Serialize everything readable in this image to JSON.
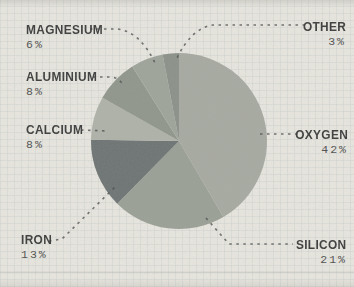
{
  "chart_data": {
    "type": "pie",
    "direction": "clockwise",
    "start_angle_deg": 0,
    "slices": [
      {
        "label": "OXYGEN",
        "pct_label": "42%",
        "value": 42,
        "color": "#a7aaa1"
      },
      {
        "label": "SILICON",
        "pct_label": "21%",
        "value": 21,
        "color": "#9aa096"
      },
      {
        "label": "IRON",
        "pct_label": "13%",
        "value": 13,
        "color": "#6c7372"
      },
      {
        "label": "CALCIUM",
        "pct_label": "8%",
        "value": 8,
        "color": "#afb2a8"
      },
      {
        "label": "ALUMINIUM",
        "pct_label": "8%",
        "value": 8,
        "color": "#90968b"
      },
      {
        "label": "MAGNESIUM",
        "pct_label": "6%",
        "value": 6,
        "color": "#9ea49a"
      },
      {
        "label": "OTHER",
        "pct_label": "3%",
        "value": 3,
        "color": "#8b9189"
      }
    ]
  },
  "colors": {
    "background": "#e9e7e0",
    "label_text": "#3a3a3a",
    "pct_text": "#4f4f4f",
    "leader_line": "#4a4a4a"
  }
}
